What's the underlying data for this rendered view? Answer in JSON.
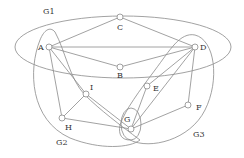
{
  "diagram": {
    "type": "graph-with-groupings",
    "colors": {
      "stroke": "#8a8a8a",
      "node_fill": "#ffffff",
      "text": "#333333"
    },
    "nodes": [
      {
        "id": "A",
        "label": "A",
        "x": 49,
        "y": 47,
        "lx": 38,
        "ly": 50
      },
      {
        "id": "B",
        "label": "B",
        "x": 120,
        "y": 67,
        "lx": 117,
        "ly": 78
      },
      {
        "id": "C",
        "label": "C",
        "x": 120,
        "y": 17,
        "lx": 117,
        "ly": 30
      },
      {
        "id": "D",
        "label": "D",
        "x": 195,
        "y": 47,
        "lx": 200,
        "ly": 50
      },
      {
        "id": "E",
        "label": "E",
        "x": 147,
        "y": 86,
        "lx": 153,
        "ly": 91
      },
      {
        "id": "F",
        "label": "F",
        "x": 188,
        "y": 105,
        "lx": 196,
        "ly": 110
      },
      {
        "id": "G",
        "label": "G",
        "x": 131,
        "y": 129,
        "lx": 124,
        "ly": 122
      },
      {
        "id": "H",
        "label": "H",
        "x": 62,
        "y": 118,
        "lx": 65,
        "ly": 130
      },
      {
        "id": "I",
        "label": "I",
        "x": 86,
        "y": 94,
        "lx": 90,
        "ly": 90
      }
    ],
    "edges": [
      [
        "A",
        "C"
      ],
      [
        "C",
        "D"
      ],
      [
        "A",
        "D"
      ],
      [
        "A",
        "B"
      ],
      [
        "B",
        "D"
      ],
      [
        "A",
        "I"
      ],
      [
        "A",
        "H"
      ],
      [
        "H",
        "I"
      ],
      [
        "I",
        "G"
      ],
      [
        "H",
        "G"
      ],
      [
        "D",
        "E"
      ],
      [
        "E",
        "G"
      ],
      [
        "D",
        "G"
      ],
      [
        "D",
        "F"
      ],
      [
        "F",
        "G"
      ]
    ],
    "groups": [
      {
        "id": "G1",
        "label": "G1",
        "lx": 43,
        "ly": 14
      },
      {
        "id": "G2",
        "label": "G2",
        "lx": 56,
        "ly": 145
      },
      {
        "id": "G3",
        "label": "G3",
        "lx": 193,
        "ly": 137
      }
    ]
  }
}
